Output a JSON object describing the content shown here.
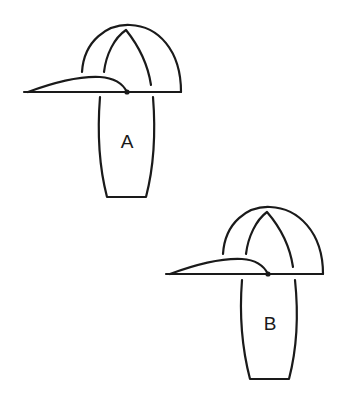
{
  "figures": [
    {
      "id": "A",
      "label": "A",
      "description": "Cap on body outline, variant A"
    },
    {
      "id": "B",
      "label": "B",
      "description": "Cap on body outline, variant B"
    }
  ],
  "colors": {
    "line": "#1a1a1a",
    "background": "#ffffff"
  }
}
